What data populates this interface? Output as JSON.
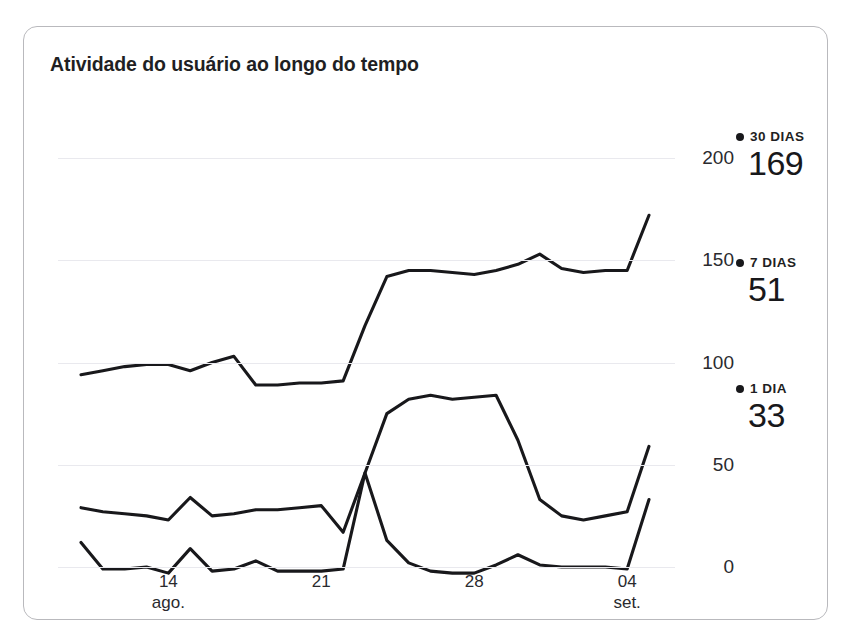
{
  "card": {
    "title": "Atividade do usuário ao longo do tempo"
  },
  "legend": {
    "items": [
      {
        "label": "30 DIAS",
        "value": "169",
        "dot": "legend-dot-icon"
      },
      {
        "label": "7 DIAS",
        "value": "51",
        "dot": "legend-dot-icon"
      },
      {
        "label": "1 DIA",
        "value": "33",
        "dot": "legend-dot-icon"
      }
    ]
  },
  "axis": {
    "y_ticks": [
      "200",
      "150",
      "100",
      "50",
      "0"
    ],
    "x_ticks": [
      {
        "day": "14",
        "month": "ago."
      },
      {
        "day": "21",
        "month": ""
      },
      {
        "day": "28",
        "month": ""
      },
      {
        "day": "04",
        "month": "set."
      }
    ]
  },
  "colors": {
    "line": "#18181b",
    "grid": "#e9e9ee",
    "card_border": "#b9b9bd",
    "background": "#ffffff",
    "text": "#1f1f23"
  },
  "chart_data": {
    "type": "line",
    "title": "Atividade do usuário ao longo do tempo",
    "xlabel": "",
    "ylabel": "",
    "ylim": [
      0,
      200
    ],
    "grid": true,
    "legend_position": "right",
    "x": [
      "10 ago.",
      "11 ago.",
      "12 ago.",
      "13 ago.",
      "14 ago.",
      "15 ago.",
      "16 ago.",
      "17 ago.",
      "18 ago.",
      "19 ago.",
      "20 ago.",
      "21 ago.",
      "22 ago.",
      "23 ago.",
      "24 ago.",
      "25 ago.",
      "26 ago.",
      "27 ago.",
      "28 ago.",
      "29 ago.",
      "30 ago.",
      "31 ago.",
      "01 set.",
      "02 set.",
      "03 set.",
      "04 set.",
      "05 set."
    ],
    "series": [
      {
        "name": "30 DIAS",
        "current_value": 169,
        "values": [
          94,
          96,
          98,
          99,
          99,
          96,
          100,
          103,
          89,
          89,
          90,
          90,
          91,
          118,
          142,
          145,
          145,
          144,
          143,
          145,
          148,
          153,
          146,
          144,
          145,
          145,
          172
        ]
      },
      {
        "name": "7 DIAS",
        "current_value": 51,
        "values": [
          29,
          27,
          26,
          25,
          23,
          34,
          25,
          26,
          28,
          28,
          29,
          30,
          17,
          46,
          75,
          82,
          84,
          82,
          83,
          84,
          62,
          33,
          25,
          23,
          25,
          27,
          59
        ]
      },
      {
        "name": "1 DIA",
        "current_value": 33,
        "values": [
          12,
          -1,
          -1,
          0,
          -3,
          9,
          -2,
          -1,
          3,
          -2,
          -2,
          -2,
          -1,
          46,
          13,
          2,
          -2,
          -3,
          -3,
          1,
          6,
          1,
          0,
          0,
          0,
          -1,
          33
        ]
      }
    ]
  }
}
